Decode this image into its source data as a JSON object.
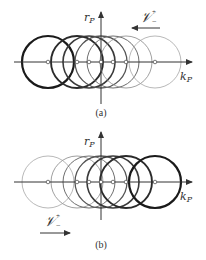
{
  "panels": [
    {
      "id": "a",
      "caption": "(a)",
      "axis_y": 62,
      "vaxis": {
        "x": 101,
        "top": 12,
        "bottom": 104
      },
      "haxis": {
        "left": 14,
        "right": 192
      },
      "y_label": "r",
      "y_label_sub": "P",
      "x_label": "k",
      "x_label_sub": "P",
      "operator_label": "𝒱",
      "operator_sup": "+",
      "operator_sub": "−",
      "arrow_direction": "left",
      "circles": [
        {
          "cx": 48,
          "r": 26,
          "stroke_width": 2.2,
          "color": "#1a1a1a"
        },
        {
          "cx": 77,
          "r": 26,
          "stroke_width": 1.9,
          "color": "#2a2a2a"
        },
        {
          "cx": 89,
          "r": 26,
          "stroke_width": 1.6,
          "color": "#3a3a3a"
        },
        {
          "cx": 101,
          "r": 26,
          "stroke_width": 1.3,
          "color": "#555555"
        },
        {
          "cx": 113,
          "r": 26,
          "stroke_width": 1.0,
          "color": "#6e6e6e"
        },
        {
          "cx": 126,
          "r": 26,
          "stroke_width": 0.8,
          "color": "#888888"
        },
        {
          "cx": 155,
          "r": 26,
          "stroke_width": 0.7,
          "color": "#999999"
        }
      ]
    },
    {
      "id": "b",
      "caption": "(b)",
      "axis_y": 182,
      "vaxis": {
        "x": 101,
        "top": 132,
        "bottom": 220
      },
      "haxis": {
        "left": 14,
        "right": 192
      },
      "y_label": "r",
      "y_label_sub": "P",
      "x_label": "k",
      "x_label_sub": "P",
      "operator_label": "𝒱",
      "operator_sup": "+",
      "operator_sub": "−",
      "arrow_direction": "right",
      "circles": [
        {
          "cx": 48,
          "r": 26,
          "stroke_width": 0.7,
          "color": "#999999"
        },
        {
          "cx": 77,
          "r": 26,
          "stroke_width": 0.8,
          "color": "#888888"
        },
        {
          "cx": 89,
          "r": 26,
          "stroke_width": 1.0,
          "color": "#6e6e6e"
        },
        {
          "cx": 101,
          "r": 26,
          "stroke_width": 1.3,
          "color": "#555555"
        },
        {
          "cx": 113,
          "r": 26,
          "stroke_width": 1.6,
          "color": "#3a3a3a"
        },
        {
          "cx": 126,
          "r": 26,
          "stroke_width": 1.9,
          "color": "#2a2a2a"
        },
        {
          "cx": 155,
          "r": 26,
          "stroke_width": 2.2,
          "color": "#1a1a1a"
        }
      ]
    }
  ]
}
